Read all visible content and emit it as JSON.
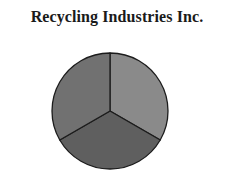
{
  "chart_data": {
    "type": "pie",
    "title": "Recycling Industries Inc.",
    "categories": [
      "Slice A",
      "Slice B",
      "Slice C"
    ],
    "values": [
      33.33,
      33.33,
      33.33
    ],
    "colors": [
      "#8a8a8a",
      "#5f5f5f",
      "#717171"
    ],
    "legend": false,
    "labels_shown": false
  },
  "chart": {
    "title": "Recycling Industries Inc."
  }
}
